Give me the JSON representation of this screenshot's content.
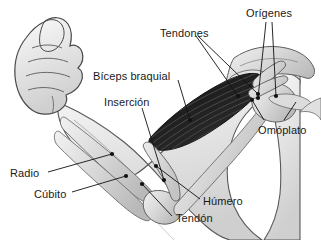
{
  "diagram": {
    "background_color": "#ffffff",
    "text_color": "#1a1a1a",
    "muscle_color": "#262626",
    "bone_color": "#d9d9d9",
    "skin_outline_color": "#555555",
    "leader_color": "#111111"
  },
  "labels": [
    {
      "id": "tendones",
      "text": "Tendones",
      "x": 160,
      "y": 28
    },
    {
      "id": "origenes",
      "text": "Orígenes",
      "x": 246,
      "y": 8
    },
    {
      "id": "biceps_braquial",
      "text": "Bíceps braquial",
      "x": 93,
      "y": 71
    },
    {
      "id": "insercion",
      "text": "Inserción",
      "x": 104,
      "y": 97
    },
    {
      "id": "omoplato",
      "text": "Omóplato",
      "x": 258,
      "y": 125
    },
    {
      "id": "radio",
      "text": "Radio",
      "x": 10,
      "y": 168
    },
    {
      "id": "cubito",
      "text": "Cúbito",
      "x": 34,
      "y": 189
    },
    {
      "id": "humero",
      "text": "Húmero",
      "x": 203,
      "y": 196
    },
    {
      "id": "tendon",
      "text": "Tendón",
      "x": 176,
      "y": 213
    }
  ],
  "structures": [
    {
      "id": "fist",
      "name": "puño cerrado"
    },
    {
      "id": "forearm",
      "name": "antebrazo"
    },
    {
      "id": "biceps",
      "name": "músculo bíceps braquial"
    },
    {
      "id": "humerus",
      "name": "húmero"
    },
    {
      "id": "radius",
      "name": "radio"
    },
    {
      "id": "ulna",
      "name": "cúbito"
    },
    {
      "id": "scapula",
      "name": "omóplato"
    },
    {
      "id": "torso",
      "name": "torso"
    }
  ]
}
